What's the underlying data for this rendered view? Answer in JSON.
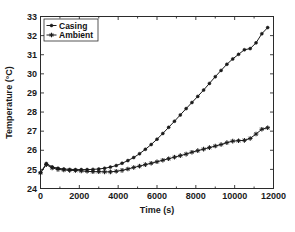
{
  "chart_data": {
    "type": "line",
    "title": "",
    "xlabel": "Time (s)",
    "ylabel": "Temperature (°C)",
    "xlim": [
      0,
      12000
    ],
    "ylim": [
      24,
      33
    ],
    "xticks": [
      0,
      2000,
      4000,
      6000,
      8000,
      10000,
      12000
    ],
    "xticklabels": [
      "0",
      "2000",
      "4000",
      "6000",
      "8000",
      "10000",
      "12000"
    ],
    "yticks": [
      24,
      25,
      26,
      27,
      28,
      29,
      30,
      31,
      32,
      33
    ],
    "yticklabels": [
      "24",
      "25",
      "26",
      "27",
      "28",
      "29",
      "30",
      "31",
      "32",
      "33"
    ],
    "grid": false,
    "legend_position": "upper left",
    "series": [
      {
        "name": "Casing",
        "marker": "dot",
        "color": "#1a1a1a",
        "x": [
          0,
          300,
          600,
          900,
          1200,
          1500,
          1800,
          2100,
          2400,
          2700,
          3000,
          3300,
          3600,
          3900,
          4200,
          4500,
          4800,
          5100,
          5400,
          5700,
          6000,
          6300,
          6600,
          6900,
          7200,
          7500,
          7800,
          8100,
          8400,
          8700,
          9000,
          9300,
          9600,
          9900,
          10200,
          10500,
          10800,
          11100,
          11400,
          11700
        ],
        "y": [
          24.82,
          25.31,
          25.13,
          25.06,
          25.02,
          25.0,
          24.99,
          24.99,
          24.99,
          25.0,
          25.02,
          25.06,
          25.12,
          25.2,
          25.32,
          25.46,
          25.62,
          25.82,
          26.05,
          26.3,
          26.58,
          26.88,
          27.2,
          27.52,
          27.85,
          28.18,
          28.5,
          28.82,
          29.15,
          29.5,
          29.85,
          30.18,
          30.5,
          30.78,
          31.02,
          31.26,
          31.32,
          31.62,
          32.1,
          32.42
        ]
      },
      {
        "name": "Ambient",
        "marker": "star",
        "color": "#1a1a1a",
        "x": [
          0,
          300,
          600,
          900,
          1200,
          1500,
          1800,
          2100,
          2400,
          2700,
          3000,
          3300,
          3600,
          3900,
          4200,
          4500,
          4800,
          5100,
          5400,
          5700,
          6000,
          6300,
          6600,
          6900,
          7200,
          7500,
          7800,
          8100,
          8400,
          8700,
          9000,
          9300,
          9600,
          9900,
          10200,
          10500,
          10800,
          11100,
          11400,
          11700
        ],
        "y": [
          24.82,
          25.25,
          25.08,
          25.0,
          24.97,
          24.95,
          24.94,
          24.92,
          24.9,
          24.88,
          24.88,
          24.87,
          24.87,
          24.9,
          24.95,
          25.02,
          25.1,
          25.17,
          25.25,
          25.32,
          25.4,
          25.48,
          25.56,
          25.64,
          25.72,
          25.8,
          25.9,
          25.98,
          26.06,
          26.14,
          26.22,
          26.3,
          26.4,
          26.48,
          26.5,
          26.52,
          26.62,
          26.85,
          27.1,
          27.18
        ]
      }
    ]
  },
  "legend": {
    "items": [
      {
        "label": "Casing"
      },
      {
        "label": "Ambient"
      }
    ]
  },
  "colors": {
    "background": "#ffffff",
    "axis": "#2b2b2b",
    "line": "#1a1a1a"
  }
}
